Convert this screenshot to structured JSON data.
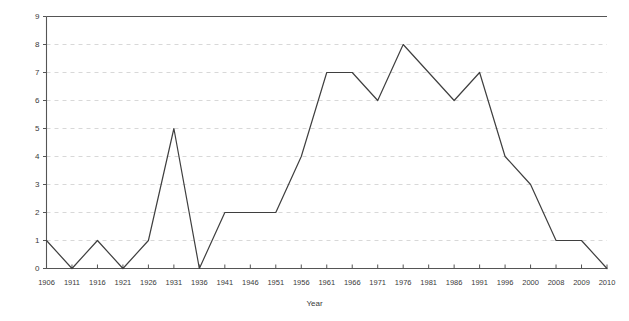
{
  "chart_data": {
    "type": "line",
    "title": "",
    "xlabel": "Year",
    "ylabel": "Number of Conferences",
    "categories": [
      "1906",
      "1911",
      "1916",
      "1921",
      "1926",
      "1931",
      "1936",
      "1941",
      "1946",
      "1951",
      "1956",
      "1961",
      "1966",
      "1971",
      "1976",
      "1981",
      "1986",
      "1991",
      "1996",
      "2000",
      "2008",
      "2009",
      "2010"
    ],
    "values": [
      1,
      0,
      1,
      0,
      1,
      5,
      0,
      2,
      2,
      2,
      4,
      7,
      7,
      6,
      8,
      7,
      6,
      7,
      4,
      3,
      1,
      1,
      0
    ],
    "ylim": [
      0,
      9
    ],
    "y_ticks": [
      "0",
      "1",
      "2",
      "3",
      "4",
      "5",
      "6",
      "7",
      "8",
      "9"
    ],
    "grid": true,
    "grid_axis": "y",
    "legend": "none",
    "series": [
      {
        "name": "Number of Conferences",
        "values": [
          1,
          0,
          1,
          0,
          1,
          5,
          0,
          2,
          2,
          2,
          4,
          7,
          7,
          6,
          8,
          7,
          6,
          7,
          4,
          3,
          1,
          1,
          0
        ]
      }
    ],
    "colors": {
      "line": "#3f3f3f",
      "grid": "#d8d8d8",
      "axis": "#555555",
      "text": "#3a3a3a",
      "background": "#ffffff"
    }
  }
}
